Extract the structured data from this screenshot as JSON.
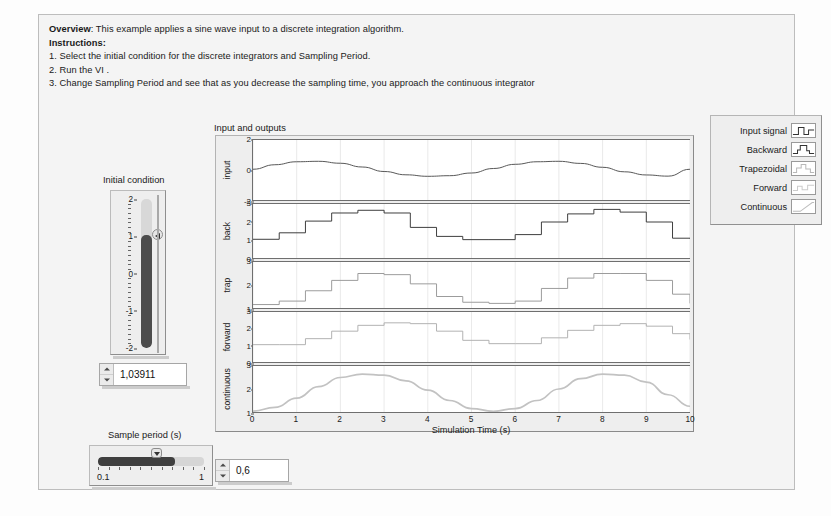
{
  "window": {
    "frame_bg": "#f4f4f4",
    "page_bg": "#fdfdfd"
  },
  "header": {
    "overview_label": "Overview",
    "overview_text": ": This example applies a sine wave input to a discrete integration algorithm.",
    "instructions_label": "Instructions:",
    "steps": [
      "1. Select the initial condition for the discrete integrators and Sampling Period.",
      "2. Run the VI .",
      "3. Change Sampling Period and see that as you decrease the sampling time, you approach the continuous integrator"
    ]
  },
  "chart": {
    "caption": "Input and outputs",
    "xlabel": "Simulation Time (s)"
  },
  "legend": {
    "items": [
      {
        "label": "Input signal",
        "icon": "step-plot-icon",
        "color": "#333333"
      },
      {
        "label": "Backward",
        "icon": "step-plot-icon",
        "color": "#333333"
      },
      {
        "label": "Trapezoidal",
        "icon": "step-plot-icon",
        "color": "#b8b8b8"
      },
      {
        "label": "Forward",
        "icon": "step-plot-icon",
        "color": "#cccccc"
      },
      {
        "label": "Continuous",
        "icon": "ramp-plot-icon",
        "color": "#bdbdbd"
      }
    ]
  },
  "initial_condition": {
    "label": "Initial condition",
    "value": "1,03911",
    "numeric_value": 1.03911,
    "min": -2,
    "max": 2,
    "ticks": [
      2,
      1,
      0,
      -1,
      -2
    ],
    "tick_labels": [
      "2",
      "1",
      "0",
      "-1",
      "-2"
    ],
    "spinner_up": "increment-arrow",
    "spinner_down": "decrement-arrow"
  },
  "sample_period": {
    "label": "Sample period (s)",
    "value": "0,6",
    "numeric_value": 0.6,
    "min": 0.1,
    "max": 1,
    "min_label": "0.1",
    "max_label": "1",
    "spinner_up": "increment-arrow",
    "spinner_down": "decrement-arrow"
  },
  "chart_data": {
    "type": "line",
    "title": "Input and outputs",
    "xlabel": "Simulation Time (s)",
    "xlim": [
      0,
      10
    ],
    "xticks": [
      0,
      1,
      2,
      3,
      4,
      5,
      6,
      7,
      8,
      9,
      10
    ],
    "grid": true,
    "sample_period": 0.6,
    "subplots": [
      {
        "ylabel": "input",
        "ylim": [
          -2,
          2
        ],
        "yticks": [
          2,
          0,
          -2
        ],
        "ytick_labels": [
          "2",
          "0",
          "-2"
        ],
        "series": [
          {
            "name": "Input signal",
            "style": "smooth-sine",
            "color": "#555555",
            "x": [
              0,
              0.5,
              1,
              1.5,
              2,
              2.5,
              3,
              3.5,
              4,
              4.5,
              5,
              5.5,
              6,
              6.5,
              7,
              7.5,
              8,
              8.5,
              9,
              9.5,
              10
            ],
            "values": [
              0.05,
              0.35,
              0.55,
              0.58,
              0.45,
              0.2,
              -0.1,
              -0.32,
              -0.42,
              -0.38,
              -0.2,
              0.1,
              0.38,
              0.55,
              0.58,
              0.44,
              0.18,
              -0.12,
              -0.33,
              -0.41,
              0.05
            ]
          }
        ]
      },
      {
        "ylabel": "back",
        "ylim": [
          0,
          3
        ],
        "yticks": [
          3,
          2,
          1,
          0
        ],
        "ytick_labels": [
          "3",
          "2",
          "1",
          "0"
        ],
        "series": [
          {
            "name": "Backward",
            "style": "staircase",
            "color": "#3b3b3b",
            "x": [
              0,
              0.6,
              1.2,
              1.8,
              2.4,
              3.0,
              3.6,
              4.2,
              4.8,
              5.4,
              6.0,
              6.6,
              7.2,
              7.8,
              8.4,
              9.0,
              9.6,
              10
            ],
            "values": [
              1.04,
              1.4,
              2.05,
              2.5,
              2.65,
              2.5,
              1.7,
              1.2,
              1.02,
              1.02,
              1.3,
              2.0,
              2.45,
              2.7,
              2.55,
              2.0,
              1.1,
              1.08
            ]
          }
        ]
      },
      {
        "ylabel": "trap",
        "ylim": [
          1,
          3
        ],
        "yticks": [
          3,
          2,
          1
        ],
        "ytick_labels": [
          "3",
          "2",
          "1"
        ],
        "series": [
          {
            "name": "Trapezoidal",
            "style": "staircase",
            "color": "#9a9a9a",
            "x": [
              0,
              0.6,
              1.2,
              1.8,
              2.4,
              3.0,
              3.6,
              4.2,
              4.8,
              5.4,
              6.0,
              6.6,
              7.2,
              7.8,
              8.4,
              9.0,
              9.6,
              10
            ],
            "values": [
              1.15,
              1.3,
              1.75,
              2.2,
              2.5,
              2.45,
              2.05,
              1.5,
              1.25,
              1.2,
              1.3,
              1.85,
              2.3,
              2.5,
              2.5,
              2.2,
              1.6,
              1.2
            ]
          }
        ]
      },
      {
        "ylabel": "forward",
        "ylim": [
          0,
          3
        ],
        "yticks": [
          3,
          2,
          1,
          0
        ],
        "ytick_labels": [
          "3",
          "2",
          "1",
          "0"
        ],
        "series": [
          {
            "name": "Forward",
            "style": "staircase",
            "color": "#b0b0b0",
            "x": [
              0,
              0.6,
              1.2,
              1.8,
              2.4,
              3.0,
              3.6,
              4.2,
              4.8,
              5.4,
              6.0,
              6.6,
              7.2,
              7.8,
              8.4,
              9.0,
              9.6,
              10
            ],
            "values": [
              1.04,
              1.04,
              1.4,
              1.85,
              2.2,
              2.35,
              2.3,
              1.85,
              1.3,
              1.1,
              1.1,
              1.45,
              1.9,
              2.2,
              2.3,
              2.15,
              1.7,
              1.35
            ]
          }
        ]
      },
      {
        "ylabel": "continuous",
        "ylim": [
          1,
          3
        ],
        "yticks": [
          3,
          2,
          1
        ],
        "ytick_labels": [
          "3",
          "2",
          "1"
        ],
        "series": [
          {
            "name": "Continuous",
            "style": "smooth",
            "color": "#c2c2c2",
            "x": [
              0,
              0.5,
              1,
              1.5,
              2,
              2.5,
              3,
              3.5,
              4,
              4.5,
              5,
              5.5,
              6,
              6.5,
              7,
              7.5,
              8,
              8.5,
              9,
              9.5,
              10
            ],
            "values": [
              1.04,
              1.2,
              1.6,
              2.1,
              2.5,
              2.65,
              2.6,
              2.35,
              1.95,
              1.5,
              1.15,
              1.03,
              1.15,
              1.5,
              2.0,
              2.45,
              2.65,
              2.6,
              2.3,
              1.75,
              1.25
            ]
          }
        ]
      }
    ]
  }
}
